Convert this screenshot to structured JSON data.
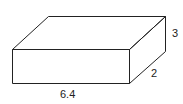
{
  "diagram": {
    "shape": "rectangular prism",
    "labels": {
      "length": "6.4",
      "depth": "2",
      "height": "3"
    },
    "colors": {
      "stroke": "#222222",
      "fill": "#ffffff"
    }
  }
}
